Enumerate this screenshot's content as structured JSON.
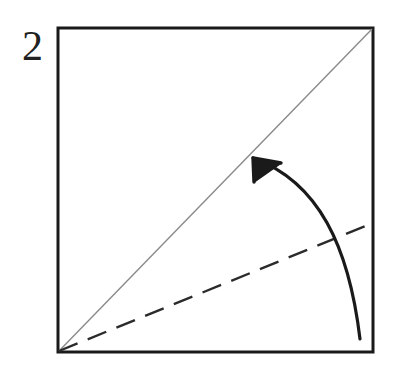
{
  "figure": {
    "step_number": "2",
    "background_color": "#ffffff",
    "ink_color": "#1a1a1a",
    "crease_color": "#8a8a8a",
    "dashed_color": "#2b2b2b"
  },
  "paper_square": {
    "label": "paper-sheet",
    "x": 58,
    "y": 28,
    "width": 315,
    "height": 324,
    "stroke_width": 3,
    "stroke_color": "#1a1a1a",
    "fill": "#ffffff"
  },
  "creases": [
    {
      "name": "existing-diagonal-crease",
      "style": "solid-thin",
      "color": "#8a8a8a",
      "stroke_width": 1.4,
      "x1": 59,
      "y1": 351,
      "x2": 372,
      "y2": 29
    },
    {
      "name": "target-fold-line",
      "style": "dashed",
      "color": "#2b2b2b",
      "stroke_width": 2.4,
      "dash_pattern": "20 11",
      "x1": 59,
      "y1": 351,
      "x2": 373,
      "y2": 223
    }
  ],
  "fold_arrow": {
    "name": "fold-direction-arrow",
    "color": "#1a1a1a",
    "stroke_width": 3.2,
    "tail_x": 360,
    "tail_y": 339,
    "tip_x": 253,
    "tip_y": 158,
    "control1_x": 349,
    "control1_y": 247,
    "control2_x": 319,
    "control2_y": 182,
    "head_left_x": 254,
    "head_left_y": 182,
    "head_right_x": 281,
    "head_right_y": 163,
    "description": "curved arrow indicating the lower right edge folds up to the diagonal"
  },
  "chart_data": {
    "type": "diagram",
    "annotations": [
      "2"
    ]
  }
}
